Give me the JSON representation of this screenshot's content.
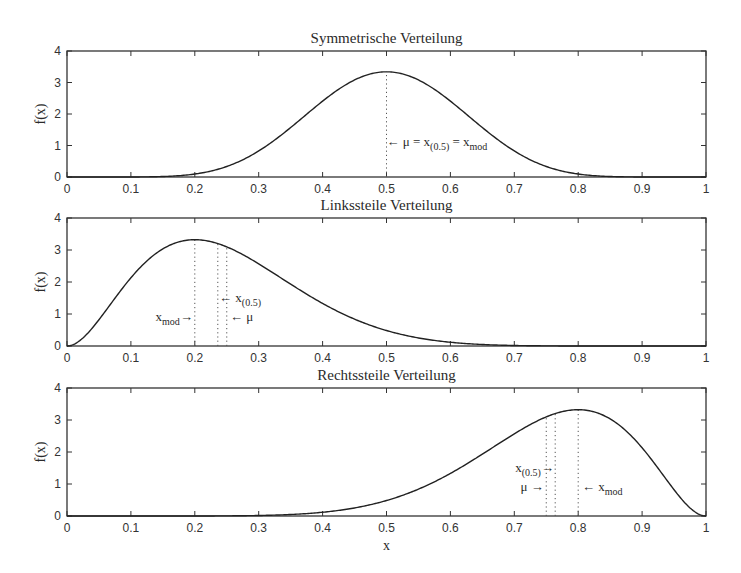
{
  "chart_data": [
    {
      "type": "line",
      "title": "Symmetrische Verteilung",
      "xlabel": "",
      "ylabel": "f(x)",
      "xlim": [
        0,
        1
      ],
      "ylim": [
        0,
        4
      ],
      "xticks": [
        "0",
        "0.1",
        "0.2",
        "0.3",
        "0.4",
        "0.5",
        "0.6",
        "0.7",
        "0.8",
        "0.9",
        "1"
      ],
      "yticks": [
        "0",
        "1",
        "2",
        "3",
        "4"
      ],
      "grid": false,
      "distribution": {
        "family": "beta",
        "a": 9,
        "b": 9
      },
      "peak": {
        "x": 0.5,
        "y": 3.34
      },
      "markers": [
        {
          "x": 0.5,
          "label": "← μ = x(0.5) = xmod"
        }
      ],
      "annotations": [
        {
          "text": "← μ = x",
          "sub": "(0.5)",
          "text2": " = x",
          "sub2": "mod",
          "x": 0.5,
          "y": 1.1,
          "anchor": "start"
        }
      ]
    },
    {
      "type": "line",
      "title": "Linkssteile Verteilung",
      "xlabel": "",
      "ylabel": "f(x)",
      "xlim": [
        0,
        1
      ],
      "ylim": [
        0,
        4
      ],
      "xticks": [
        "0",
        "0.1",
        "0.2",
        "0.3",
        "0.4",
        "0.5",
        "0.6",
        "0.7",
        "0.8",
        "0.9",
        "1"
      ],
      "yticks": [
        "0",
        "1",
        "2",
        "3",
        "4"
      ],
      "grid": false,
      "distribution": {
        "family": "beta",
        "a": 3,
        "b": 9
      },
      "peak": {
        "x": 0.2,
        "y": 3.32
      },
      "markers": [
        {
          "x": 0.2,
          "label": "xmod"
        },
        {
          "x": 0.236,
          "label": "x(0.5)"
        },
        {
          "x": 0.25,
          "label": "μ"
        }
      ],
      "annotations": [
        {
          "text": "x",
          "sub": "mod",
          "text2": "→",
          "x": 0.197,
          "y": 0.9,
          "anchor": "end"
        },
        {
          "text": "← x",
          "sub": "(0.5)",
          "x": 0.238,
          "y": 1.5,
          "anchor": "start"
        },
        {
          "text": "← μ",
          "x": 0.255,
          "y": 0.9,
          "anchor": "start"
        }
      ]
    },
    {
      "type": "line",
      "title": "Rechtssteile Verteilung",
      "xlabel": "x",
      "ylabel": "f(x)",
      "xlim": [
        0,
        1
      ],
      "ylim": [
        0,
        4
      ],
      "xticks": [
        "0",
        "0.1",
        "0.2",
        "0.3",
        "0.4",
        "0.5",
        "0.6",
        "0.7",
        "0.8",
        "0.9",
        "1"
      ],
      "yticks": [
        "0",
        "1",
        "2",
        "3",
        "4"
      ],
      "grid": false,
      "distribution": {
        "family": "beta",
        "a": 9,
        "b": 3
      },
      "peak": {
        "x": 0.8,
        "y": 3.32
      },
      "markers": [
        {
          "x": 0.75,
          "label": "μ"
        },
        {
          "x": 0.764,
          "label": "x(0.5)"
        },
        {
          "x": 0.8,
          "label": "xmod"
        }
      ],
      "annotations": [
        {
          "text": "x",
          "sub": "(0.5)",
          "text2": "→",
          "x": 0.762,
          "y": 1.5,
          "anchor": "end"
        },
        {
          "text": "μ →",
          "x": 0.746,
          "y": 0.9,
          "anchor": "end"
        },
        {
          "text": "← x",
          "sub": "mod",
          "x": 0.806,
          "y": 0.9,
          "anchor": "start"
        }
      ]
    }
  ],
  "layout": {
    "panels": [
      {
        "left": 67,
        "right": 706,
        "top": 51,
        "bottom": 177
      },
      {
        "left": 67,
        "right": 706,
        "top": 218,
        "bottom": 346
      },
      {
        "left": 67,
        "right": 706,
        "top": 388,
        "bottom": 516
      }
    ]
  }
}
